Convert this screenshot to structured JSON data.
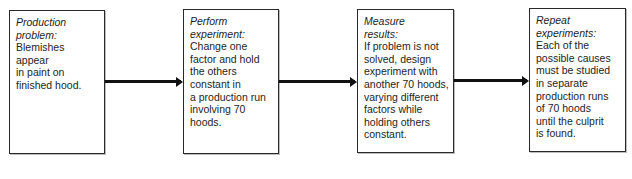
{
  "diagram": {
    "type": "flowchart",
    "steps": [
      {
        "heading": [
          "Production",
          "problem:"
        ],
        "body": [
          "Blemishes",
          "appear",
          "in paint on",
          "finished hood."
        ]
      },
      {
        "heading": [
          "Perform",
          "experiment:"
        ],
        "body": [
          "Change one",
          "factor and hold",
          "the others",
          "constant in",
          "a production run",
          "involving 70",
          "hoods."
        ]
      },
      {
        "heading": [
          "Measure",
          "results:"
        ],
        "body": [
          "If problem is not",
          "solved, design",
          "experiment with",
          "another 70 hoods,",
          "varying different",
          "factors while",
          "holding others",
          "constant."
        ]
      },
      {
        "heading": [
          "Repeat",
          "experiments:"
        ],
        "body": [
          "Each of the",
          "possible causes",
          "must be studied",
          "in separate",
          "production runs",
          "of 70 hoods",
          "until the culprit",
          "is found."
        ]
      }
    ],
    "arrows": [
      {
        "from": 0,
        "to": 1
      },
      {
        "from": 1,
        "to": 2
      },
      {
        "from": 2,
        "to": 3
      }
    ]
  }
}
